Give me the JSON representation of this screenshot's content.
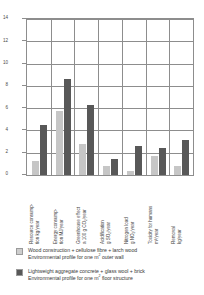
{
  "chart_data": {
    "type": "bar",
    "title": "",
    "xlabel": "",
    "ylabel": "",
    "ylim": [
      0,
      14
    ],
    "yticks": [
      0,
      2,
      4,
      6,
      8,
      10,
      12,
      14
    ],
    "grid": true,
    "legend_position": "bottom",
    "categories": [
      "Resource consumption kg/year",
      "Energy consumption MJ/year",
      "Greenhouse effect a 100 g CO2/year",
      "Acidification g SO2/year",
      "Nitrogen load g NO2/year",
      "Toxicity for humans m3/year",
      "Removal kg/year"
    ],
    "category_lines": [
      [
        "Resource consump-",
        "tion kg/year"
      ],
      [
        "Energy consump-",
        "tion MJ/year"
      ],
      [
        "Greenhouse effect",
        "a 100 g CO₂/year"
      ],
      [
        "Acidification",
        "g SO₂/year"
      ],
      [
        "Nitrogen load",
        "g NO₂/year"
      ],
      [
        "Toxicity for humans",
        "m³/year"
      ],
      [
        "Removal",
        "kg/year"
      ]
    ],
    "series": [
      {
        "name": "Wood construction + cellulose fibre + larch wood",
        "color": "#c6c6c6",
        "values": [
          1.25,
          5.75,
          2.75,
          0.85,
          0.35,
          1.75,
          0.85
        ]
      },
      {
        "name": "Lightweight aggregate concrete + glass wool + brick",
        "color": "#585858",
        "values": [
          4.45,
          8.65,
          6.25,
          1.45,
          2.6,
          2.45,
          3.1
        ]
      }
    ]
  },
  "legend": {
    "items": [
      {
        "swatch": "light",
        "line1": "Wood construction + cellulose fibre + larch wood",
        "line2_pre": "Environmental profile for one m",
        "line2_sup": "2",
        "line2_post": " outer wall"
      },
      {
        "swatch": "dark",
        "line1": "Lightweight aggregate  concrete + glass wool + brick",
        "line2_pre": "Environmental profile for one m",
        "line2_sup": "2",
        "line2_post": " floor structure"
      }
    ]
  },
  "axis": {
    "y_labels": [
      "14",
      "12",
      "10",
      "8",
      "6",
      "4",
      "2",
      "0"
    ]
  }
}
